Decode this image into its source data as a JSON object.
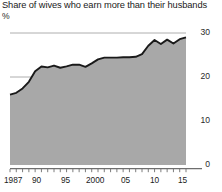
{
  "chart_data": {
    "type": "area",
    "title": "Share of wives who earn more than their husbands",
    "unit_label": "%",
    "xlabel": "",
    "ylabel": "%",
    "ylim": [
      0,
      30
    ],
    "xlim": [
      1987,
      2015
    ],
    "grid": true,
    "gridlines": [
      10,
      20,
      30
    ],
    "legend": "none",
    "y_ticks": [
      "0",
      "10",
      "20",
      "30"
    ],
    "y_tick_values": [
      0,
      10,
      20,
      30
    ],
    "x_ticks": [
      "1987",
      "90",
      "95",
      "2000",
      "05",
      "10",
      "15"
    ],
    "x_tick_values": [
      1987,
      1990,
      1995,
      2000,
      2005,
      2010,
      2015
    ],
    "series_name": "Share of wives who earn more than their husbands",
    "x": [
      1987,
      1988,
      1989,
      1990,
      1991,
      1992,
      1993,
      1994,
      1995,
      1996,
      1997,
      1998,
      1999,
      2000,
      2001,
      2002,
      2003,
      2004,
      2005,
      2006,
      2007,
      2008,
      2009,
      2010,
      2011,
      2012,
      2013,
      2014,
      2015
    ],
    "values": [
      16.0,
      16.4,
      17.4,
      18.9,
      21.3,
      22.4,
      22.2,
      22.6,
      22.1,
      22.4,
      22.8,
      22.8,
      22.3,
      23.1,
      24.0,
      24.4,
      24.4,
      24.4,
      24.5,
      24.5,
      24.6,
      25.2,
      27.1,
      28.4,
      27.5,
      28.5,
      27.6,
      28.6,
      29.0
    ],
    "colors": {
      "area_fill": "#a8a8a8",
      "line": "#1a1a1a",
      "gridline": "#9a9a9a",
      "axis": "#6e6e6e",
      "text": "#1a1a1a",
      "background": "#ffffff"
    }
  }
}
